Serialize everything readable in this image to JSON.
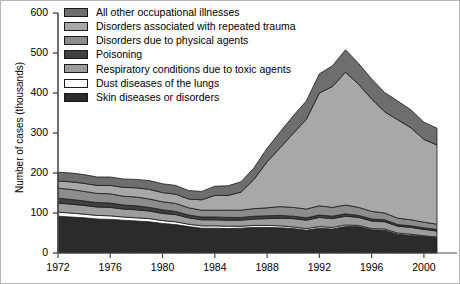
{
  "axes": {
    "ylabel": "Number of cases (thousands)",
    "yticks": [
      "0",
      "100",
      "200",
      "300",
      "400",
      "500",
      "600"
    ],
    "ytick_values": [
      0,
      100,
      200,
      300,
      400,
      500,
      600
    ],
    "xticks": [
      "1972",
      "1976",
      "1980",
      "1984",
      "1988",
      "1992",
      "1996",
      "2000"
    ],
    "xtick_values": [
      1972,
      1976,
      1980,
      1984,
      1988,
      1992,
      1996,
      2000
    ]
  },
  "legend": {
    "items": [
      {
        "label": "All other occupational illnesses",
        "color": "#6e6e6e",
        "key": "all_other"
      },
      {
        "label": "Disorders associated with repeated trauma",
        "color": "#a8a8a8",
        "key": "repeated_trauma"
      },
      {
        "label": "Disorders due to physical agents",
        "color": "#8c8c8c",
        "key": "physical_agents"
      },
      {
        "label": "Poisoning",
        "color": "#404040",
        "key": "poisoning"
      },
      {
        "label": "Respiratory conditions due to toxic agents",
        "color": "#9d9d9d",
        "key": "respiratory"
      },
      {
        "label": "Dust diseases of the lungs",
        "color": "#ffffff",
        "key": "dust"
      },
      {
        "label": "Skin diseases or disorders",
        "color": "#2b2b2b",
        "key": "skin"
      }
    ]
  },
  "chart_data": {
    "type": "area",
    "title": "",
    "xlabel": "",
    "ylabel": "Number of cases (thousands)",
    "xlim": [
      1972,
      2001
    ],
    "ylim": [
      0,
      600
    ],
    "grid": false,
    "legend_position": "top-left",
    "stacked": true,
    "stack_order_bottom_to_top": [
      "skin",
      "dust",
      "respiratory",
      "poisoning",
      "physical_agents",
      "repeated_trauma",
      "all_other"
    ],
    "x": [
      1972,
      1973,
      1974,
      1975,
      1976,
      1977,
      1978,
      1979,
      1980,
      1981,
      1982,
      1983,
      1984,
      1985,
      1986,
      1987,
      1988,
      1989,
      1990,
      1991,
      1992,
      1993,
      1994,
      1995,
      1996,
      1997,
      1998,
      1999,
      2000,
      2001
    ],
    "series": [
      {
        "name": "Skin diseases or disorders",
        "color": "#2b2b2b",
        "values": [
          92,
          90,
          88,
          85,
          84,
          82,
          80,
          78,
          74,
          71,
          66,
          62,
          62,
          61,
          62,
          64,
          64,
          63,
          61,
          57,
          62,
          60,
          66,
          66,
          58,
          57,
          47,
          44,
          41,
          38
        ]
      },
      {
        "name": "Dust diseases of the lungs",
        "color": "#ffffff",
        "values": [
          10,
          10,
          9,
          9,
          9,
          8,
          8,
          8,
          7,
          7,
          6,
          6,
          6,
          6,
          5,
          5,
          5,
          5,
          4,
          4,
          4,
          4,
          4,
          3,
          3,
          3,
          3,
          3,
          2,
          2
        ]
      },
      {
        "name": "Respiratory conditions due to toxic agents",
        "color": "#9d9d9d",
        "values": [
          23,
          22,
          22,
          21,
          21,
          20,
          20,
          19,
          18,
          18,
          16,
          15,
          15,
          15,
          15,
          16,
          17,
          19,
          21,
          21,
          23,
          22,
          22,
          20,
          19,
          18,
          17,
          17,
          16,
          15
        ]
      },
      {
        "name": "Poisoning",
        "color": "#404040",
        "values": [
          12,
          12,
          11,
          11,
          11,
          10,
          10,
          9,
          9,
          8,
          7,
          7,
          7,
          7,
          7,
          7,
          7,
          7,
          6,
          6,
          6,
          6,
          6,
          5,
          5,
          5,
          4,
          4,
          4,
          4
        ]
      },
      {
        "name": "Disorders due to physical agents",
        "color": "#8c8c8c",
        "values": [
          25,
          25,
          24,
          23,
          23,
          22,
          22,
          21,
          20,
          20,
          18,
          17,
          17,
          18,
          18,
          19,
          20,
          22,
          22,
          22,
          23,
          22,
          22,
          20,
          19,
          17,
          16,
          15,
          14,
          13
        ]
      },
      {
        "name": "Disorders associated with repeated trauma",
        "color": "#a8a8a8",
        "values": [
          18,
          19,
          20,
          20,
          21,
          22,
          23,
          24,
          23,
          23,
          22,
          26,
          37,
          37,
          45,
          73,
          115,
          147,
          185,
          224,
          282,
          302,
          332,
          308,
          281,
          253,
          246,
          230,
          207,
          198
        ]
      },
      {
        "name": "All other occupational illnesses",
        "color": "#6e6e6e",
        "values": [
          22,
          22,
          22,
          21,
          21,
          21,
          21,
          22,
          22,
          22,
          21,
          21,
          23,
          24,
          26,
          29,
          34,
          40,
          44,
          46,
          48,
          52,
          56,
          52,
          50,
          48,
          47,
          45,
          43,
          42
        ]
      }
    ],
    "totals": [
      202,
      200,
      196,
      190,
      190,
      185,
      184,
      181,
      173,
      169,
      156,
      154,
      167,
      168,
      178,
      213,
      262,
      303,
      343,
      380,
      448,
      468,
      508,
      474,
      435,
      401,
      380,
      358,
      327,
      312
    ]
  }
}
